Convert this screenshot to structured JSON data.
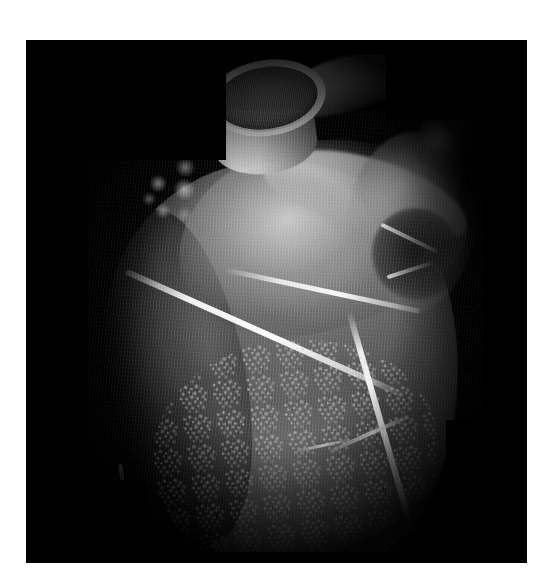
{
  "figure": {
    "domain": "medical-volume-rendering",
    "modality": "3D volume-rendered cardiac CT angiography",
    "caption": "",
    "colors": {
      "page_background": "#ffffff",
      "image_background": "#000000",
      "tissue_mid_gray": "#6d6d6d",
      "tissue_bright_gray": "#c8c8c8",
      "vessel_highlight": "#f5f5f5",
      "lumen_dark_gray": "#4a4a4a"
    },
    "panel": {
      "left": 26,
      "top": 40,
      "width": 501,
      "height": 523
    }
  },
  "anatomy": {
    "aorta": {
      "label": "ascending-aorta-cut-cylinder",
      "note": "cylindrical cut plane showing dark lumen ringed by bright wall"
    },
    "pulmonary_artery": {
      "label": "pulmonary-trunk-stub"
    },
    "left_atrial_appendage": {
      "label": "left-atrial-appendage"
    },
    "right_atrium": {
      "label": "right-atrium-mass"
    },
    "superior_vena_cava": {
      "label": "superior-vena-cava-nub"
    },
    "right_ventricle": {
      "label": "right-ventricle-outflow-ridge"
    },
    "left_ventricle": {
      "label": "left-ventricle-mass"
    },
    "apex": {
      "label": "cardiac-apex"
    },
    "vessels": [
      {
        "label": "right-coronary-artery-av-groove"
      },
      {
        "label": "coronary-branch-parallel"
      },
      {
        "label": "right-marginal-artery"
      },
      {
        "label": "coronary-branch-superior"
      },
      {
        "label": "coronary-branch-mid"
      },
      {
        "label": "coronary-branch-inferior"
      },
      {
        "label": "coronary-branch-apical"
      },
      {
        "label": "apical-vessel"
      }
    ]
  }
}
